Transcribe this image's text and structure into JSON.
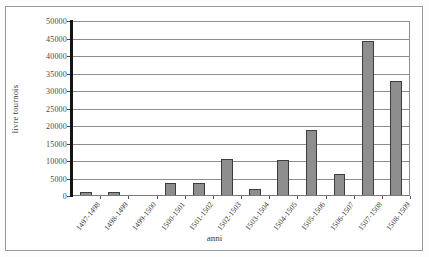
{
  "chart_data": {
    "type": "bar",
    "title": "",
    "xlabel": "anni",
    "ylabel": "livre tournois",
    "categories": [
      "1497-1498",
      "1498-1499",
      "1499-1500",
      "1500-1501",
      "1501-1502",
      "1502-1503",
      "1503-1504",
      "1504-1505",
      "1505-1506",
      "1506-1507",
      "1507-1508",
      "1508-1509"
    ],
    "values": [
      1200,
      1100,
      0,
      3800,
      3800,
      10700,
      2100,
      10300,
      19000,
      6300,
      44200,
      33000
    ],
    "ylim": [
      0,
      50000
    ],
    "ytick_labels": [
      "0",
      "5000",
      "10000",
      "15000",
      "20000",
      "25000",
      "30000",
      "35000",
      "40000",
      "45000",
      "50000"
    ],
    "ytick_values": [
      0,
      5000,
      10000,
      15000,
      20000,
      25000,
      30000,
      35000,
      40000,
      45000,
      50000
    ],
    "grid": true,
    "legend": "none",
    "bar_color": "#8e8e8e",
    "bar_edge_color": "#3d3d3d",
    "axis_color": "#141414",
    "grid_color": "#8d8d8d",
    "plot_background": "#ffffff"
  }
}
